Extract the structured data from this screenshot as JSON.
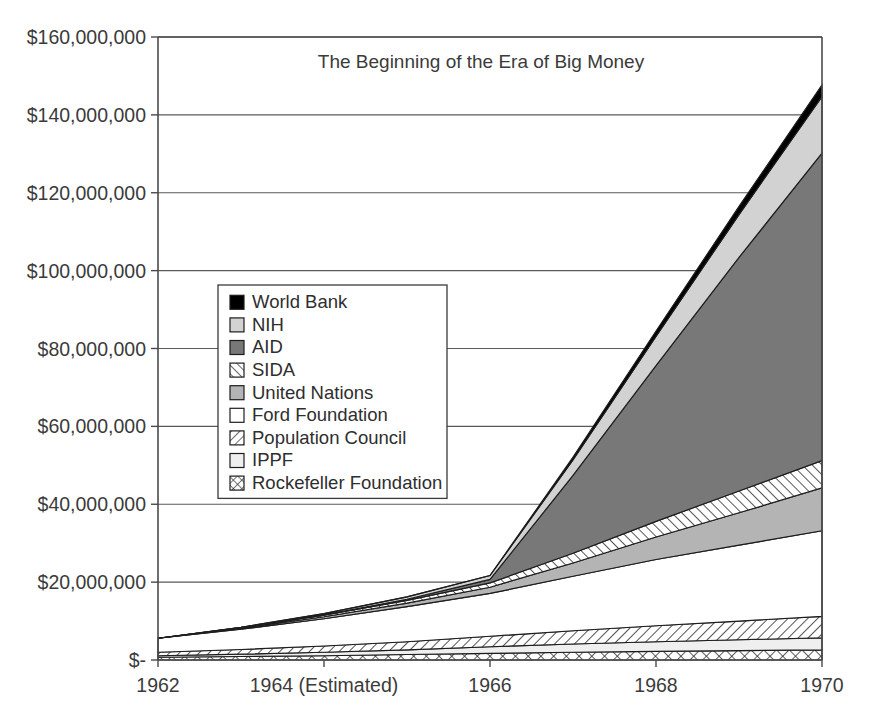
{
  "chart_data": {
    "type": "area",
    "title": "The Beginning of the Era of Big Money",
    "subtitle": "",
    "xlabel": "",
    "ylabel": "",
    "stacked": true,
    "grid": true,
    "legend_position": "inside-left",
    "x": [
      1962,
      1963,
      1964,
      1965,
      1966,
      1967,
      1968,
      1969,
      1970
    ],
    "xlim": [
      1962,
      1970
    ],
    "ylim": [
      0,
      160000000
    ],
    "x_tick_values": [
      1962,
      1964,
      1966,
      1968,
      1970
    ],
    "x_tick_labels": [
      "1962",
      "1964 (Estimated)",
      "1966",
      "1968",
      "1970"
    ],
    "y_tick_values": [
      0,
      20000000,
      40000000,
      60000000,
      80000000,
      100000000,
      120000000,
      140000000,
      160000000
    ],
    "y_tick_labels": [
      "$-",
      "$20,000,000",
      "$40,000,000",
      "$60,000,000",
      "$80,000,000",
      "$100,000,000",
      "$120,000,000",
      "$140,000,000",
      "$160,000,000"
    ],
    "stack_order_bottom_to_top": [
      "Rockefeller Foundation",
      "IPPF",
      "Population Council",
      "Ford Foundation",
      "United Nations",
      "SIDA",
      "AID",
      "NIH",
      "World Bank"
    ],
    "series": [
      {
        "name": "Rockefeller Foundation",
        "pattern": "crosshatch",
        "fill": "#ffffff",
        "values": [
          700000,
          900000,
          1100000,
          1400000,
          1700000,
          2000000,
          2200000,
          2400000,
          2600000
        ]
      },
      {
        "name": "IPPF",
        "pattern": "solid",
        "fill": "#efefef",
        "values": [
          400000,
          600000,
          900000,
          1200000,
          1700000,
          2100000,
          2500000,
          2800000,
          3100000
        ]
      },
      {
        "name": "Population Council",
        "pattern": "diagonal-forward",
        "fill": "#ffffff",
        "values": [
          900000,
          1200000,
          1600000,
          2100000,
          2700000,
          3400000,
          4100000,
          4800000,
          5500000
        ]
      },
      {
        "name": "Ford Foundation",
        "pattern": "solid",
        "fill": "#ffffff",
        "values": [
          3600000,
          5200000,
          7000000,
          9000000,
          11000000,
          14000000,
          17000000,
          19500000,
          22000000
        ]
      },
      {
        "name": "United Nations",
        "pattern": "solid",
        "fill": "#b4b4b4",
        "values": [
          0,
          200000,
          500000,
          900000,
          1600000,
          3400000,
          5800000,
          8300000,
          11000000
        ]
      },
      {
        "name": "SIDA",
        "pattern": "diagonal-back",
        "fill": "#ffffff",
        "values": [
          0,
          200000,
          400000,
          700000,
          1100000,
          2500000,
          4000000,
          5600000,
          7000000
        ]
      },
      {
        "name": "AID",
        "pattern": "solid",
        "fill": "#787878",
        "values": [
          0,
          0,
          100000,
          300000,
          900000,
          20000000,
          40000000,
          60000000,
          79000000
        ]
      },
      {
        "name": "NIH",
        "pattern": "solid",
        "fill": "#d2d2d2",
        "values": [
          0,
          100000,
          300000,
          600000,
          1000000,
          4000000,
          7500000,
          11000000,
          14500000
        ]
      },
      {
        "name": "World Bank",
        "pattern": "solid",
        "fill": "#000000",
        "values": [
          0,
          0,
          0,
          0,
          0,
          700000,
          1400000,
          2100000,
          3000000
        ]
      }
    ],
    "totals": [
      5600000,
      8400000,
      11900000,
      16200000,
      21700000,
      52100000,
      84500000,
      116500000,
      145700000
    ]
  },
  "legend": {
    "items": [
      {
        "label": "World Bank",
        "swatch": "solid-black"
      },
      {
        "label": "NIH",
        "swatch": "solid-light-gray"
      },
      {
        "label": "AID",
        "swatch": "solid-dark-gray"
      },
      {
        "label": "SIDA",
        "swatch": "diagonal-back"
      },
      {
        "label": "United Nations",
        "swatch": "solid-medium-gray"
      },
      {
        "label": "Ford Foundation",
        "swatch": "solid-white"
      },
      {
        "label": "Population Council",
        "swatch": "diagonal-forward"
      },
      {
        "label": "IPPF",
        "swatch": "solid-very-light-gray"
      },
      {
        "label": "Rockefeller Foundation",
        "swatch": "crosshatch"
      }
    ]
  },
  "colors": {
    "world_bank": "#000000",
    "nih": "#d2d2d2",
    "aid": "#787878",
    "sida": "#ffffff",
    "united_nations": "#b4b4b4",
    "ford_foundation": "#ffffff",
    "population_council": "#ffffff",
    "ippf": "#efefef",
    "rockefeller_foundation": "#ffffff",
    "axis": "#4a4a4a",
    "grid": "#5a5a5a",
    "text": "#3b3b3b",
    "outline": "#1d1d1d",
    "background": "#ffffff"
  }
}
